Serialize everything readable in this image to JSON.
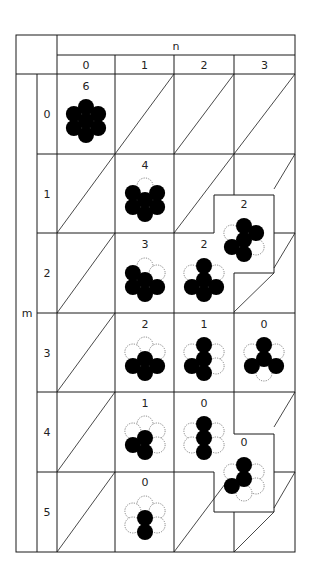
{
  "table": {
    "col_axis_label": "n",
    "row_axis_label": "m",
    "col_headers": [
      "0",
      "1",
      "2",
      "3"
    ],
    "row_headers": [
      "0",
      "1",
      "2",
      "3",
      "4",
      "5"
    ]
  },
  "geometry": {
    "outer": {
      "x1": 16,
      "y1": 35,
      "x2": 295,
      "y2": 552
    },
    "row_label_split_x": 37,
    "col_x": [
      57,
      115,
      174,
      234,
      295
    ],
    "header_split_y": 55,
    "row_y": [
      74,
      154,
      233,
      313,
      392,
      472,
      552
    ],
    "atom_r": 8
  },
  "cells": [
    {
      "m": 0,
      "n": 0,
      "count": "6",
      "cx": 86,
      "cy": 121,
      "ty": 90,
      "filled": [
        "T",
        "UR",
        "LR",
        "B",
        "LL",
        "UL",
        "C"
      ],
      "dotted": []
    },
    {
      "m": 1,
      "n": 1,
      "count": "4",
      "cx": 145,
      "cy": 200,
      "ty": 169,
      "filled": [
        "UR",
        "LR",
        "B",
        "LL",
        "UL",
        "C"
      ],
      "dotted": [
        "T"
      ]
    },
    {
      "m": 1,
      "n": 3,
      "count": "2",
      "cx": 244,
      "cy": 240,
      "ty": 208,
      "boxed": true,
      "filled": [
        "T",
        "UR",
        "C",
        "LL",
        "B"
      ],
      "dotted": [
        "UL",
        "LR"
      ]
    },
    {
      "m": 2,
      "n": 1,
      "count": "3",
      "cx": 145,
      "cy": 280,
      "ty": 248,
      "filled": [
        "UL",
        "C",
        "LL",
        "B",
        "LR"
      ],
      "dotted": [
        "T",
        "UR"
      ]
    },
    {
      "m": 2,
      "n": 2,
      "count": "2",
      "cx": 204,
      "cy": 280,
      "ty": 248,
      "filled": [
        "T",
        "C",
        "LL",
        "B",
        "LR"
      ],
      "dotted": [
        "UL",
        "UR"
      ]
    },
    {
      "m": 3,
      "n": 1,
      "count": "2",
      "cx": 145,
      "cy": 359,
      "ty": 328,
      "filled": [
        "C",
        "LL",
        "LR",
        "B"
      ],
      "dotted": [
        "T",
        "UL",
        "UR"
      ]
    },
    {
      "m": 3,
      "n": 2,
      "count": "1",
      "cx": 204,
      "cy": 359,
      "ty": 328,
      "filled": [
        "T",
        "C",
        "LL",
        "B"
      ],
      "dotted": [
        "UL",
        "UR",
        "LR"
      ]
    },
    {
      "m": 3,
      "n": 3,
      "count": "0",
      "cx": 264,
      "cy": 359,
      "ty": 328,
      "filled": [
        "T",
        "C",
        "LL",
        "LR"
      ],
      "dotted": [
        "UL",
        "UR",
        "B"
      ]
    },
    {
      "m": 4,
      "n": 1,
      "count": "1",
      "cx": 145,
      "cy": 438,
      "ty": 407,
      "filled": [
        "C",
        "LL",
        "B"
      ],
      "dotted": [
        "T",
        "UL",
        "UR",
        "LR"
      ]
    },
    {
      "m": 4,
      "n": 2,
      "count": "0",
      "cx": 204,
      "cy": 438,
      "ty": 407,
      "filled": [
        "T",
        "C",
        "B"
      ],
      "dotted": [
        "UL",
        "UR",
        "LL",
        "LR"
      ]
    },
    {
      "m": 4,
      "n": 3,
      "count": "0",
      "cx": 244,
      "cy": 479,
      "ty": 446,
      "boxed": true,
      "filled": [
        "T",
        "C",
        "LL"
      ],
      "dotted": [
        "UL",
        "UR",
        "LR",
        "B"
      ]
    },
    {
      "m": 5,
      "n": 1,
      "count": "0",
      "cx": 145,
      "cy": 518,
      "ty": 486,
      "filled": [
        "C",
        "B"
      ],
      "dotted": [
        "T",
        "UL",
        "UR",
        "LL",
        "LR"
      ]
    }
  ],
  "empty_cells_with_diagonal": [
    {
      "m": 0,
      "n": 1
    },
    {
      "m": 0,
      "n": 2
    },
    {
      "m": 0,
      "n": 3
    },
    {
      "m": 1,
      "n": 0
    },
    {
      "m": 1,
      "n": 2
    },
    {
      "m": 2,
      "n": 0
    },
    {
      "m": 3,
      "n": 0
    },
    {
      "m": 4,
      "n": 0
    },
    {
      "m": 5,
      "n": 0
    },
    {
      "m": 5,
      "n": 2
    }
  ],
  "partial_diagonals": [
    {
      "x1": 274,
      "y1": 189,
      "x2": 295,
      "y2": 154
    },
    {
      "x1": 274,
      "y1": 268,
      "x2": 295,
      "y2": 233
    },
    {
      "x1": 234,
      "y1": 312,
      "x2": 274,
      "y2": 273
    },
    {
      "x1": 274,
      "y1": 427,
      "x2": 295,
      "y2": 392
    },
    {
      "x1": 274,
      "y1": 508,
      "x2": 295,
      "y2": 472
    },
    {
      "x1": 234,
      "y1": 552,
      "x2": 274,
      "y2": 512
    }
  ],
  "offset_boxes": [
    {
      "path": "M214,233 L214,195 L274,195 L274,273 L234,273"
    },
    {
      "path": "M234,392 L234,434 L274,434 L274,512 L214,512 L214,472"
    }
  ],
  "legend": {
    "filled_atom": "occupied",
    "dotted_atom": "vacant"
  }
}
